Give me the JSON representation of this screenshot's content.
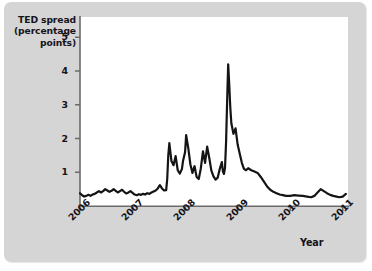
{
  "chart_data": {
    "type": "line",
    "title": "",
    "subtitle": "",
    "xlabel": "Year",
    "ylabel": "TED spread (percentage points)",
    "ylabel_lines": [
      "TED spread",
      "(percentage",
      "points)"
    ],
    "xlim": [
      2006,
      2011.1
    ],
    "ylim": [
      0,
      5.6
    ],
    "grid": false,
    "legend": null,
    "y_ticks": [
      1,
      2,
      3,
      4,
      5
    ],
    "y_tick_labels": [
      "1",
      "2",
      "3",
      "4",
      "5"
    ],
    "x_ticks": [
      2006,
      2007,
      2008,
      2009,
      2010,
      2011
    ],
    "x_tick_labels": [
      "2006",
      "2007",
      "2008",
      "2009",
      "2010",
      "2011"
    ],
    "line_color": "#161316",
    "line_width": 2.2,
    "series": [
      {
        "name": "TED spread",
        "x": [
          2006.0,
          2006.04,
          2006.08,
          2006.12,
          2006.16,
          2006.2,
          2006.24,
          2006.28,
          2006.32,
          2006.36,
          2006.4,
          2006.44,
          2006.48,
          2006.52,
          2006.56,
          2006.6,
          2006.64,
          2006.68,
          2006.72,
          2006.76,
          2006.8,
          2006.84,
          2006.88,
          2006.92,
          2006.96,
          2007.0,
          2007.04,
          2007.08,
          2007.12,
          2007.16,
          2007.2,
          2007.24,
          2007.28,
          2007.32,
          2007.36,
          2007.4,
          2007.44,
          2007.48,
          2007.52,
          2007.56,
          2007.6,
          2007.64,
          2007.66,
          2007.68,
          2007.7,
          2007.74,
          2007.78,
          2007.82,
          2007.86,
          2007.9,
          2007.94,
          2007.96,
          2008.0,
          2008.02,
          2008.06,
          2008.1,
          2008.14,
          2008.18,
          2008.22,
          2008.26,
          2008.3,
          2008.34,
          2008.38,
          2008.42,
          2008.46,
          2008.5,
          2008.54,
          2008.58,
          2008.62,
          2008.66,
          2008.7,
          2008.72,
          2008.74,
          2008.76,
          2008.78,
          2008.8,
          2008.82,
          2008.84,
          2008.86,
          2008.88,
          2008.92,
          2008.96,
          2009.0,
          2009.04,
          2009.08,
          2009.12,
          2009.16,
          2009.2,
          2009.26,
          2009.32,
          2009.38,
          2009.44,
          2009.5,
          2009.56,
          2009.62,
          2009.68,
          2009.74,
          2009.8,
          2009.86,
          2009.92,
          2010.0,
          2010.08,
          2010.16,
          2010.24,
          2010.32,
          2010.4,
          2010.46,
          2010.52,
          2010.58,
          2010.64,
          2010.7,
          2010.76,
          2010.82,
          2010.88,
          2010.94,
          2011.0,
          2011.06
        ],
        "y": [
          0.38,
          0.32,
          0.28,
          0.3,
          0.33,
          0.3,
          0.34,
          0.36,
          0.4,
          0.44,
          0.4,
          0.44,
          0.5,
          0.46,
          0.42,
          0.45,
          0.5,
          0.45,
          0.4,
          0.44,
          0.48,
          0.42,
          0.37,
          0.4,
          0.44,
          0.39,
          0.34,
          0.32,
          0.35,
          0.33,
          0.36,
          0.34,
          0.38,
          0.36,
          0.4,
          0.43,
          0.46,
          0.52,
          0.62,
          0.52,
          0.46,
          0.47,
          0.8,
          1.5,
          1.86,
          1.33,
          1.21,
          1.48,
          1.06,
          0.96,
          1.1,
          1.33,
          1.6,
          2.1,
          1.72,
          1.24,
          0.98,
          1.18,
          0.86,
          0.8,
          1.12,
          1.62,
          1.28,
          1.76,
          1.42,
          1.05,
          0.88,
          0.78,
          0.84,
          1.1,
          1.3,
          1.02,
          0.95,
          1.14,
          1.9,
          3.1,
          4.2,
          3.6,
          2.92,
          2.45,
          2.14,
          2.3,
          1.82,
          1.55,
          1.28,
          1.1,
          1.06,
          1.12,
          1.06,
          1.02,
          0.98,
          0.86,
          0.72,
          0.58,
          0.48,
          0.42,
          0.38,
          0.34,
          0.32,
          0.3,
          0.3,
          0.32,
          0.31,
          0.3,
          0.28,
          0.26,
          0.3,
          0.4,
          0.5,
          0.44,
          0.38,
          0.33,
          0.3,
          0.28,
          0.26,
          0.28,
          0.36
        ]
      }
    ],
    "annotations": {
      "peak_value": 4.2,
      "peak_year": 2008.82
    }
  }
}
